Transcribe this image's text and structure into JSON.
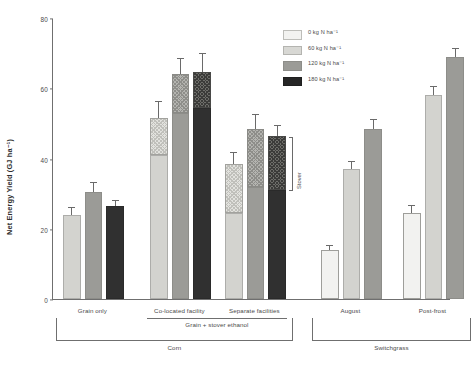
{
  "chart_data": {
    "type": "bar",
    "title": "",
    "xlabel": "",
    "ylabel": "Net Energy Yield (GJ ha⁻¹)",
    "ylim": [
      0,
      80
    ],
    "yticks": [
      0,
      20,
      40,
      60,
      80
    ],
    "grid": false,
    "legend_position": "top-right",
    "legend": [
      {
        "label": "0 kg N ha⁻¹",
        "key": "0",
        "color": "#f2f2f0"
      },
      {
        "label": "60 kg N ha⁻¹",
        "key": "60",
        "color": "#d8d8d4"
      },
      {
        "label": "120 kg N ha⁻¹",
        "key": "120",
        "color": "#9b9b97"
      },
      {
        "label": "180 kg N ha⁻¹",
        "key": "180",
        "color": "#262626"
      }
    ],
    "stack_components": [
      "Grain",
      "Stover"
    ],
    "annotations": [
      {
        "text": "Stover",
        "target": "separate-facilities-180-stover"
      }
    ],
    "supergroups": [
      {
        "label": "Corn",
        "subgroups": [
          "Grain only",
          "Co-located facility",
          "Separate facilities"
        ]
      },
      {
        "label": "Switchgrass",
        "subgroups": [
          "August",
          "Post-frost"
        ]
      }
    ],
    "intermediate_groups": [
      {
        "label": "Grain + stover ethanol",
        "subgroups": [
          "Co-located facility",
          "Separate facilities"
        ]
      }
    ],
    "groups": [
      {
        "name": "Grain only",
        "crop": "Corn",
        "bars": [
          {
            "n_rate": "60",
            "grain": 24.0,
            "stover": 0,
            "total": 24.0,
            "error": 2.0
          },
          {
            "n_rate": "120",
            "grain": 30.5,
            "stover": 0,
            "total": 30.5,
            "error": 2.6
          },
          {
            "n_rate": "180",
            "grain": 26.5,
            "stover": 0,
            "total": 26.5,
            "error": 1.3
          }
        ]
      },
      {
        "name": "Co-located facility",
        "crop": "Corn",
        "bars": [
          {
            "n_rate": "60",
            "grain": 41.0,
            "stover": 10.5,
            "total": 51.5,
            "error": 4.5
          },
          {
            "n_rate": "120",
            "grain": 53.0,
            "stover": 11.0,
            "total": 64.0,
            "error": 4.3
          },
          {
            "n_rate": "180",
            "grain": 54.5,
            "stover": 10.0,
            "total": 64.5,
            "error": 5.3
          }
        ]
      },
      {
        "name": "Separate facilities",
        "crop": "Corn",
        "bars": [
          {
            "n_rate": "60",
            "grain": 24.5,
            "stover": 14.0,
            "total": 38.5,
            "error": 3.2
          },
          {
            "n_rate": "120",
            "grain": 32.0,
            "stover": 16.5,
            "total": 48.5,
            "error": 3.8
          },
          {
            "n_rate": "180",
            "grain": 31.0,
            "stover": 15.5,
            "total": 46.5,
            "error": 2.9
          }
        ]
      },
      {
        "name": "August",
        "crop": "Switchgrass",
        "bars": [
          {
            "n_rate": "0",
            "grain": 14.0,
            "stover": 0,
            "total": 14.0,
            "error": 1.2
          },
          {
            "n_rate": "60",
            "grain": 37.0,
            "stover": 0,
            "total": 37.0,
            "error": 1.9
          },
          {
            "n_rate": "120",
            "grain": 48.5,
            "stover": 0,
            "total": 48.5,
            "error": 2.4
          }
        ]
      },
      {
        "name": "Post-frost",
        "crop": "Switchgrass",
        "bars": [
          {
            "n_rate": "0",
            "grain": 24.5,
            "stover": 0,
            "total": 24.5,
            "error": 2.0
          },
          {
            "n_rate": "60",
            "grain": 58.0,
            "stover": 0,
            "total": 58.0,
            "error": 2.5
          },
          {
            "n_rate": "120",
            "grain": 69.0,
            "stover": 0,
            "total": 69.0,
            "error": 2.3
          }
        ]
      }
    ]
  }
}
